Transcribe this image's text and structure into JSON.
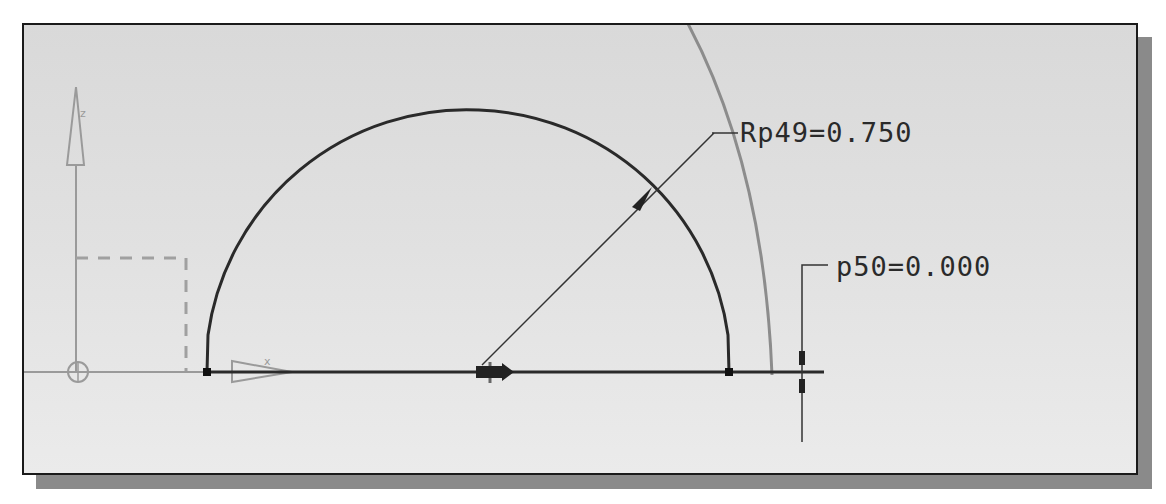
{
  "viewport": {
    "background": "#e0e0e0",
    "border_color": "#1a1a1a",
    "shadow_color": "#8a8a8a"
  },
  "dimensions": {
    "radius": {
      "label": "Rp49=0.750",
      "name": "Rp49",
      "value": "0.750"
    },
    "vertical": {
      "label": "p50=0.000",
      "name": "p50",
      "value": "0.000"
    }
  },
  "geometry": {
    "arc": {
      "type": "semicircle",
      "color": "#2a2a2a"
    },
    "reference_arc": {
      "color": "#8c8c8c"
    },
    "axis_line": {
      "color": "#2a2a2a"
    }
  },
  "sketch_origin": {
    "horizontal_axis_label": "x",
    "vertical_axis_label": "z",
    "color": "#9a9a9a"
  }
}
